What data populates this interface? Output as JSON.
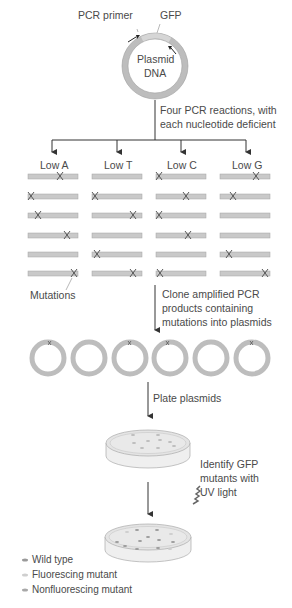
{
  "plasmid": {
    "primer_label": "PCR primer",
    "gene_label": "GFP",
    "name_line1": "Plasmid",
    "name_line2": "DNA"
  },
  "steps": {
    "step1_line1": "Four PCR reactions, with",
    "step1_line2": "each nucleotide deficient",
    "step2_line1": "Clone amplified PCR",
    "step2_line2": "products containing",
    "step2_line3": "mutations into plasmids",
    "step3": "Plate plasmids",
    "step4_line1": "Identify GFP",
    "step4_line2": "mutants with",
    "step4_line3": "UV light"
  },
  "reactions": [
    {
      "label": "Low A"
    },
    {
      "label": "Low T"
    },
    {
      "label": "Low C"
    },
    {
      "label": "Low G"
    }
  ],
  "mutations_label": "Mutations",
  "legend": [
    {
      "label": "Wild type",
      "color": "#9a9a9a"
    },
    {
      "label": "Fluorescing mutant",
      "color": "#cfcfcf"
    },
    {
      "label": "Nonfluorescing mutant",
      "color": "#a8a8a8"
    }
  ],
  "colors": {
    "dna_fill": "#c9c9c9",
    "dna_stroke": "#9a9a9a",
    "arrow": "#333333"
  }
}
